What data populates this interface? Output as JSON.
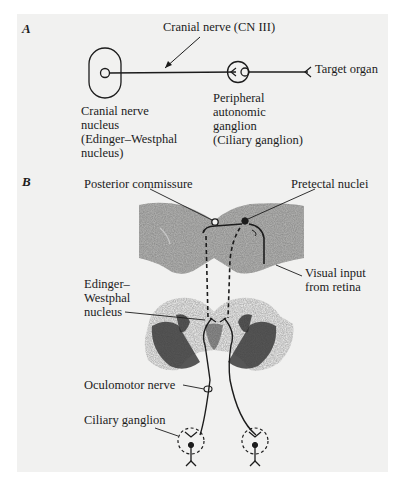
{
  "figure": {
    "panel_a": {
      "letter": "A",
      "cranial_nerve_label": "Cranial nerve (CN III)",
      "target_label": "Target organ",
      "nucleus_label": [
        "Cranial nerve",
        "nucleus",
        "(Edinger–Westphal",
        "nucleus)"
      ],
      "ganglion_label": [
        "Peripheral",
        "autonomic",
        "ganglion",
        "(Ciliary ganglion)"
      ]
    },
    "panel_b": {
      "letter": "B",
      "posterior_commissure": "Posterior commissure",
      "pretectal_nuclei": "Pretectal nuclei",
      "visual_input": [
        "Visual input",
        "from retina"
      ],
      "edinger_westphal": [
        "Edinger–",
        "Westphal",
        "nucleus"
      ],
      "oculomotor_nerve": "Oculomotor nerve",
      "ciliary_ganglion": "Ciliary ganglion"
    }
  },
  "colors": {
    "panel_bg": "#f1f1f0",
    "ink": "#1c1c1c",
    "tissue": "#5a5a5a"
  }
}
